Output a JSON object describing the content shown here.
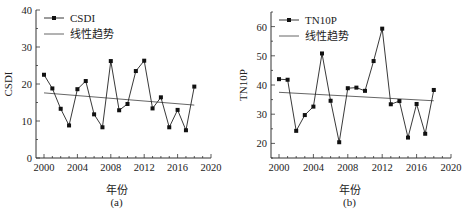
{
  "chart_data": [
    {
      "type": "line",
      "panel_label": "(a)",
      "title": "",
      "xlabel": "年份",
      "ylabel": "CSDI",
      "x": [
        2000,
        2001,
        2002,
        2003,
        2004,
        2005,
        2006,
        2007,
        2008,
        2009,
        2010,
        2011,
        2012,
        2013,
        2014,
        2015,
        2016,
        2017,
        2018
      ],
      "series": [
        {
          "name": "CSDI",
          "marker": "square",
          "values": [
            22.5,
            18.8,
            13.3,
            8.8,
            18.6,
            20.8,
            11.8,
            8.3,
            26.2,
            12.9,
            14.6,
            23.5,
            26.3,
            13.4,
            16.4,
            8.3,
            13.0,
            7.5,
            19.3
          ]
        },
        {
          "name": "线性趋势",
          "marker": "none",
          "values": [
            17.6,
            14.3
          ],
          "x": [
            2000,
            2018
          ]
        }
      ],
      "xlim": [
        2000,
        2020
      ],
      "ylim": [
        0,
        40
      ],
      "xticks": [
        2000,
        2004,
        2008,
        2012,
        2016,
        2020
      ],
      "yticks": [
        0,
        10,
        20,
        30,
        40
      ],
      "legend": [
        "CSDI",
        "线性趋势"
      ],
      "legend_position": "top-left",
      "grid": false
    },
    {
      "type": "line",
      "panel_label": "(b)",
      "title": "",
      "xlabel": "年份",
      "ylabel": "TN10P",
      "x": [
        2000,
        2001,
        2002,
        2003,
        2004,
        2005,
        2006,
        2007,
        2008,
        2009,
        2010,
        2011,
        2012,
        2013,
        2014,
        2015,
        2016,
        2017,
        2018
      ],
      "series": [
        {
          "name": "TN10P",
          "marker": "square",
          "values": [
            42.0,
            41.8,
            24.3,
            29.7,
            32.6,
            50.8,
            34.6,
            20.4,
            38.9,
            39.1,
            38.0,
            48.2,
            59.3,
            33.4,
            34.5,
            22.0,
            33.5,
            23.3,
            38.3
          ]
        },
        {
          "name": "线性趋势",
          "marker": "none",
          "values": [
            37.5,
            34.6
          ],
          "x": [
            2000,
            2018
          ]
        }
      ],
      "xlim": [
        2000,
        2020
      ],
      "ylim": [
        15,
        65
      ],
      "xticks": [
        2000,
        2004,
        2008,
        2012,
        2016,
        2020
      ],
      "yticks": [
        20,
        30,
        40,
        50,
        60
      ],
      "legend": [
        "TN10P",
        "线性趋势"
      ],
      "legend_position": "top-left",
      "grid": false
    }
  ],
  "colors": {
    "line": "#222222",
    "trend": "#555555",
    "axis": "#333333"
  }
}
